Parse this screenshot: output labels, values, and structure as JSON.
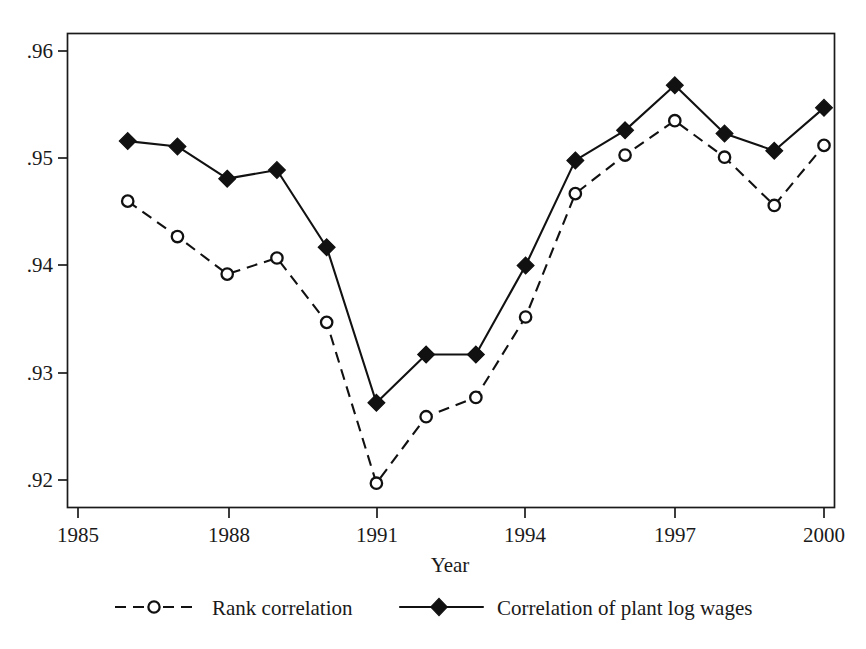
{
  "chart_data": {
    "type": "line",
    "title": "",
    "subtitle": "",
    "xlabel": "Year",
    "ylabel": "",
    "x": [
      1986,
      1987,
      1988,
      1989,
      1990,
      1991,
      1992,
      1993,
      1994,
      1995,
      1996,
      1997,
      1998,
      1999,
      2000
    ],
    "xlim": [
      1985.0,
      2000.2
    ],
    "ylim": [
      0.9185,
      0.9605
    ],
    "xticks": [
      1985,
      1988,
      1991,
      1994,
      1997,
      2000
    ],
    "xticklabels": [
      "1985",
      "1988",
      "1991",
      "1994",
      "1997",
      "2000"
    ],
    "yticks": [
      0.92,
      0.93,
      0.94,
      0.95,
      0.96
    ],
    "yticklabels": [
      ".92",
      ".93",
      ".94",
      ".95",
      ".96"
    ],
    "grid": false,
    "legend_position": "below-axes",
    "series": [
      {
        "name": "Rank correlation",
        "marker": "open-circle",
        "linestyle": "dashed",
        "color": "#111111",
        "values": [
          0.946,
          0.9427,
          0.9392,
          0.9407,
          0.9347,
          0.9197,
          0.9259,
          0.9277,
          0.9352,
          0.9467,
          0.9503,
          0.9535,
          0.9501,
          0.9456,
          0.9512
        ]
      },
      {
        "name": "Correlation of plant log wages",
        "marker": "filled-diamond",
        "linestyle": "solid",
        "color": "#111111",
        "values": [
          0.9516,
          0.9511,
          0.9481,
          0.9489,
          0.9417,
          0.9272,
          0.9317,
          0.9317,
          0.94,
          0.9498,
          0.9526,
          0.9568,
          0.9523,
          0.9507,
          0.9547
        ]
      }
    ]
  },
  "axes": {
    "x_title": "Year",
    "y_tick_labels": [
      ".96",
      ".95",
      ".94",
      ".93",
      ".92"
    ],
    "x_tick_labels": [
      "1985",
      "1988",
      "1991",
      "1994",
      "1997",
      "2000"
    ]
  },
  "legend": {
    "entries": [
      {
        "label": "Rank correlation",
        "marker": "open-circle",
        "linestyle": "dashed"
      },
      {
        "label": "Correlation of plant log wages",
        "marker": "filled-diamond",
        "linestyle": "solid"
      }
    ]
  },
  "colors": {
    "ink": "#111111",
    "background": "#ffffff"
  }
}
